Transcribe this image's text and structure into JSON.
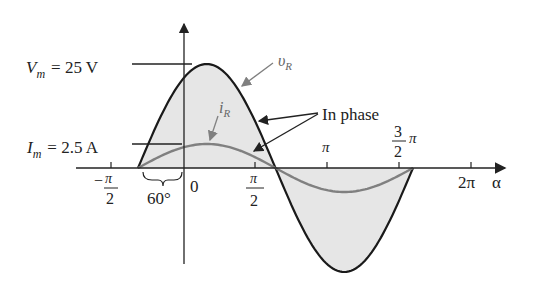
{
  "diagram": {
    "labels": {
      "vm_sym": "V",
      "vm_sub": "m",
      "vm_val": "= 25 V",
      "im_sym": "I",
      "im_sub": "m",
      "im_val": "= 2.5 A",
      "vr_sym": "υ",
      "vr_sub": "R",
      "ir_sym": "i",
      "ir_sub": "R",
      "in_phase": "In phase",
      "phase_shift": "60°",
      "x_axis": "α"
    },
    "ticks": [
      {
        "num": "π",
        "den": "2",
        "sign": "−",
        "label": "-π/2"
      },
      {
        "label": "0"
      },
      {
        "num": "π",
        "den": "2",
        "label": "π/2"
      },
      {
        "label": "π"
      },
      {
        "num": "3",
        "den": "2",
        "suffix": "π",
        "label": "3π/2"
      },
      {
        "label": "2π"
      }
    ],
    "colors": {
      "voltage": "#1a1a1a",
      "current": "#808080",
      "fill": "#e6e6e6",
      "axis": "#222222"
    }
  },
  "chart_data": {
    "type": "line",
    "title": "",
    "xlabel": "α",
    "ylabel": "",
    "x_ticks": [
      "-π/2",
      "0",
      "π/2",
      "π",
      "3π/2",
      "2π"
    ],
    "series": [
      {
        "name": "υR",
        "amplitude": 25,
        "unit": "V",
        "phase_deg": 60,
        "expression": "25 sin(α + 60°)"
      },
      {
        "name": "iR",
        "amplitude": 2.5,
        "unit": "A",
        "phase_deg": 60,
        "expression": "2.5 sin(α + 60°)"
      }
    ],
    "annotations": [
      "Vm = 25 V",
      "Im = 2.5 A",
      "In phase",
      "60°"
    ]
  }
}
